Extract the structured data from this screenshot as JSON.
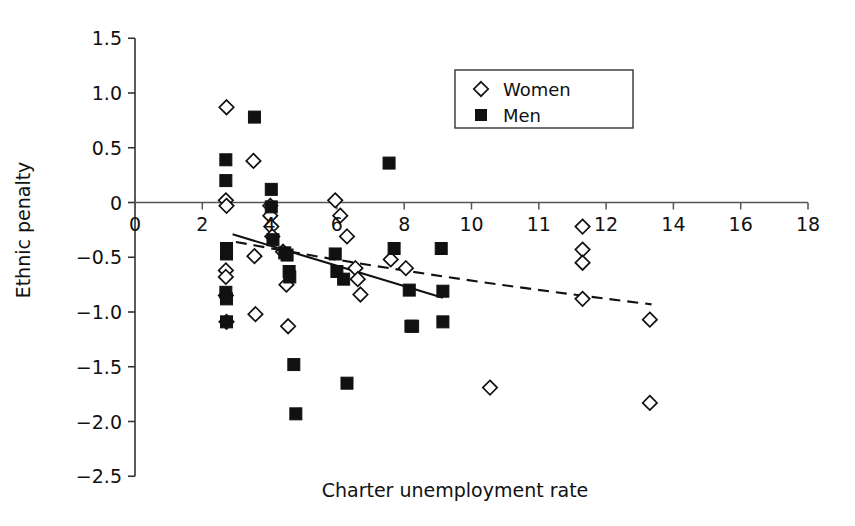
{
  "chart_data": {
    "type": "scatter",
    "title": "",
    "xlabel": "Charter unemployment rate",
    "ylabel": "Ethnic penalty",
    "xlim": [
      0,
      18
    ],
    "ylim": [
      -2.5,
      1.5
    ],
    "grid": false,
    "legend_position": "top-right",
    "xticks": [
      {
        "value": 0,
        "label": "0"
      },
      {
        "value": 2,
        "label": "2"
      },
      {
        "value": 4,
        "label": "4"
      },
      {
        "value": 6,
        "label": "6"
      },
      {
        "value": 8,
        "label": "8"
      },
      {
        "value": 10,
        "label": "10"
      },
      {
        "value": 12,
        "label": "11"
      },
      {
        "value": 14,
        "label": "12"
      },
      {
        "value": 16,
        "label": "14"
      },
      {
        "value": 18,
        "label": "16"
      },
      {
        "value": 20,
        "label": "18"
      }
    ],
    "yticks": [
      {
        "value": 1.5,
        "label": "1.5"
      },
      {
        "value": 1.0,
        "label": "1.0"
      },
      {
        "value": 0.5,
        "label": "0.5"
      },
      {
        "value": 0.0,
        "label": "0"
      },
      {
        "value": -0.5,
        "label": "-0.5"
      },
      {
        "value": -1.0,
        "label": "-1.0"
      },
      {
        "value": -1.5,
        "label": "-1.5"
      },
      {
        "value": -2.0,
        "label": "-2.0"
      },
      {
        "value": -2.5,
        "label": "-2.5"
      }
    ],
    "legend": [
      {
        "label": "Women",
        "marker": "open-diamond",
        "color": "#ffffff",
        "stroke": "#111111"
      },
      {
        "label": "Men",
        "marker": "filled-square",
        "color": "#111111",
        "stroke": "#111111"
      }
    ],
    "series": [
      {
        "name": "Women",
        "marker": "open-diamond",
        "points": [
          [
            2.72,
            0.87
          ],
          [
            2.7,
            0.02
          ],
          [
            2.72,
            -0.03
          ],
          [
            2.7,
            -0.62
          ],
          [
            2.7,
            -0.68
          ],
          [
            2.7,
            -0.85
          ],
          [
            2.72,
            -1.09
          ],
          [
            3.52,
            0.38
          ],
          [
            3.55,
            -0.49
          ],
          [
            3.58,
            -1.02
          ],
          [
            4.02,
            -0.03
          ],
          [
            4.02,
            -0.12
          ],
          [
            4.05,
            -0.22
          ],
          [
            4.08,
            -0.31
          ],
          [
            4.4,
            -0.45
          ],
          [
            4.5,
            -0.75
          ],
          [
            4.55,
            -1.13
          ],
          [
            5.95,
            0.02
          ],
          [
            6.1,
            -0.12
          ],
          [
            6.3,
            -0.31
          ],
          [
            6.55,
            -0.6
          ],
          [
            6.62,
            -0.7
          ],
          [
            6.7,
            -0.84
          ],
          [
            7.6,
            -0.52
          ],
          [
            8.05,
            -0.6
          ],
          [
            10.55,
            -1.69
          ],
          [
            13.3,
            -0.22
          ],
          [
            13.3,
            -0.43
          ],
          [
            13.3,
            -0.55
          ],
          [
            13.3,
            -0.88
          ],
          [
            15.3,
            -1.07
          ],
          [
            15.3,
            -1.83
          ]
        ]
      },
      {
        "name": "Men",
        "marker": "filled-square",
        "points": [
          [
            2.7,
            0.39
          ],
          [
            2.7,
            0.2
          ],
          [
            2.72,
            -0.42
          ],
          [
            2.72,
            -0.47
          ],
          [
            2.7,
            -0.82
          ],
          [
            2.72,
            -0.88
          ],
          [
            2.72,
            -1.09
          ],
          [
            3.55,
            0.78
          ],
          [
            4.05,
            0.12
          ],
          [
            4.05,
            -0.04
          ],
          [
            4.1,
            -0.34
          ],
          [
            4.45,
            -0.46
          ],
          [
            4.52,
            -0.48
          ],
          [
            4.58,
            -0.63
          ],
          [
            4.6,
            -0.68
          ],
          [
            4.72,
            -1.48
          ],
          [
            4.78,
            -1.93
          ],
          [
            5.95,
            -0.47
          ],
          [
            6.0,
            -0.63
          ],
          [
            6.2,
            -0.7
          ],
          [
            6.3,
            -1.65
          ],
          [
            7.55,
            0.36
          ],
          [
            7.7,
            -0.42
          ],
          [
            8.15,
            -0.8
          ],
          [
            8.2,
            -1.13
          ],
          [
            8.25,
            -1.13
          ],
          [
            9.1,
            -0.42
          ],
          [
            9.15,
            -0.81
          ],
          [
            9.15,
            -1.09
          ]
        ]
      }
    ],
    "trendlines": [
      {
        "name": "Men trend",
        "style": "solid",
        "x_start": 2.9,
        "x_end": 9.15,
        "y_start": -0.29,
        "y_end": -0.87
      },
      {
        "name": "Women trend",
        "style": "dashed",
        "x_start": 3.0,
        "x_end": 15.35,
        "y_start": -0.36,
        "y_end": -0.93,
        "curvature": 0.22
      }
    ]
  }
}
